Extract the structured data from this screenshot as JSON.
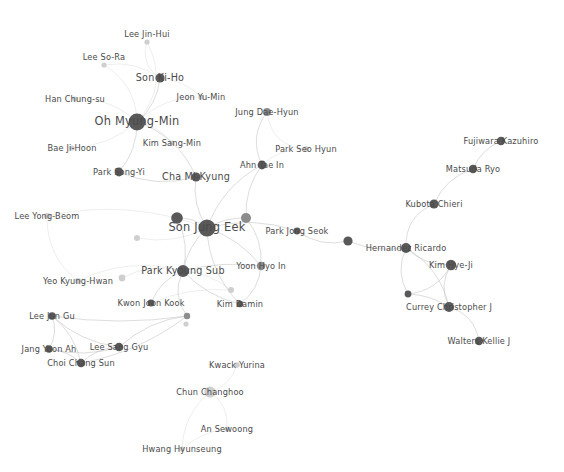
{
  "figure": {
    "type": "network-graph",
    "title": "",
    "background_color": "#ffffff",
    "node_color_dark": "#595959",
    "node_color_mid": "#8c8c8c",
    "node_color_light": "#cfcfcf",
    "edge_color": "#b9b9b9",
    "label_color": "#4a4a4a",
    "width": 564,
    "height": 472
  },
  "chart_data": {
    "type": "scatter",
    "title": "",
    "xlabel": "",
    "ylabel": "",
    "layout": "force-directed node-link diagram",
    "grid": false,
    "legend": "none",
    "node_count": 42,
    "nodes": [
      {
        "id": "lee-jin-hui",
        "label": "Lee Jin-Hui",
        "x": 147,
        "y": 42,
        "r": 2.6,
        "tone": "light",
        "label_dx": 0,
        "label_dy": -8,
        "size_class": "small"
      },
      {
        "id": "lee-so-ra",
        "label": "Lee So-Ra",
        "x": 104,
        "y": 65,
        "r": 2.6,
        "tone": "light",
        "label_dx": 0,
        "label_dy": -8,
        "size_class": "small"
      },
      {
        "id": "son-ki-ho",
        "label": "Son Ki-Ho",
        "x": 160,
        "y": 78,
        "r": 4.6,
        "tone": "dark",
        "label_dx": 0,
        "label_dy": 0,
        "size_class": "mid"
      },
      {
        "id": "han-chung-su",
        "label": "Han Chung-su",
        "x": 75,
        "y": 99,
        "r": 2.6,
        "tone": "light",
        "label_dx": 0,
        "label_dy": 0,
        "size_class": "small"
      },
      {
        "id": "jeon-yu-min",
        "label": "Jeon Yu-Min",
        "x": 201,
        "y": 97,
        "r": 2.6,
        "tone": "light",
        "label_dx": 0,
        "label_dy": 0,
        "size_class": "small"
      },
      {
        "id": "oh-myung-min",
        "label": "Oh Myung-Min",
        "x": 137,
        "y": 122,
        "r": 8.4,
        "tone": "dark",
        "label_dx": 0,
        "label_dy": 0,
        "size_class": "big"
      },
      {
        "id": "jung-dae-hyun",
        "label": "Jung Dae-Hyun",
        "x": 267,
        "y": 112,
        "r": 4.0,
        "tone": "mid",
        "label_dx": 0,
        "label_dy": 0,
        "size_class": "small"
      },
      {
        "id": "kim-sang-min",
        "label": "Kim Sang-Min",
        "x": 172,
        "y": 143,
        "r": 2.6,
        "tone": "light",
        "label_dx": 0,
        "label_dy": 0,
        "size_class": "small"
      },
      {
        "id": "park-seo-hyun",
        "label": "Park Seo Hyun",
        "x": 306,
        "y": 149,
        "r": 2.8,
        "tone": "light",
        "label_dx": 0,
        "label_dy": 0,
        "size_class": "small"
      },
      {
        "id": "bae-ji-hoon",
        "label": "Bae Ji-Hoon",
        "x": 72,
        "y": 148,
        "r": 2.6,
        "tone": "light",
        "label_dx": 0,
        "label_dy": 0,
        "size_class": "small"
      },
      {
        "id": "ahn-tae-in",
        "label": "Ahn Tae In",
        "x": 262,
        "y": 165,
        "r": 4.4,
        "tone": "dark",
        "label_dx": 0,
        "label_dy": 0,
        "size_class": "small"
      },
      {
        "id": "park-song-yi",
        "label": "Park Song-Yi",
        "x": 119,
        "y": 172,
        "r": 4.4,
        "tone": "dark",
        "label_dx": 0,
        "label_dy": 0,
        "size_class": "small"
      },
      {
        "id": "cha-mi-kyung",
        "label": "Cha Mi-Kyung",
        "x": 196,
        "y": 177,
        "r": 4.6,
        "tone": "dark",
        "label_dx": 0,
        "label_dy": 0,
        "size_class": "mid"
      },
      {
        "id": "fujiwara-kazuhiro",
        "label": "Fujiwara Kazuhiro",
        "x": 501,
        "y": 141,
        "r": 4.2,
        "tone": "dark",
        "label_dx": 0,
        "label_dy": 0,
        "size_class": "small"
      },
      {
        "id": "matsuda-ryo",
        "label": "Matsuda Ryo",
        "x": 473,
        "y": 169,
        "r": 4.2,
        "tone": "dark",
        "label_dx": 0,
        "label_dy": 0,
        "size_class": "small"
      },
      {
        "id": "kubota-chieri",
        "label": "Kubota Chieri",
        "x": 434,
        "y": 204,
        "r": 4.6,
        "tone": "dark",
        "label_dx": 0,
        "label_dy": 0,
        "size_class": "small"
      },
      {
        "id": "lee-yong-beom",
        "label": "Lee Yong-Beom",
        "x": 47,
        "y": 216,
        "r": 3.0,
        "tone": "light",
        "label_dx": 0,
        "label_dy": 0,
        "size_class": "small"
      },
      {
        "id": "son-jung-eek",
        "label": "Son Jung Eek",
        "x": 207,
        "y": 228,
        "r": 8.6,
        "tone": "dark",
        "label_dx": 0,
        "label_dy": 0,
        "size_class": "big"
      },
      {
        "id": "node-unlabeled-a",
        "label": "",
        "x": 177,
        "y": 218,
        "r": 5.8,
        "tone": "dark",
        "label_dx": 0,
        "label_dy": 0,
        "size_class": "small"
      },
      {
        "id": "node-unlabeled-b",
        "label": "",
        "x": 246,
        "y": 218,
        "r": 5.0,
        "tone": "mid",
        "label_dx": 0,
        "label_dy": 0,
        "size_class": "small"
      },
      {
        "id": "node-unlabeled-c",
        "label": "",
        "x": 137,
        "y": 238,
        "r": 3.0,
        "tone": "light",
        "label_dx": 0,
        "label_dy": 0,
        "size_class": "small"
      },
      {
        "id": "park-jong-seok",
        "label": "Park Jong Seok",
        "x": 297,
        "y": 231,
        "r": 3.4,
        "tone": "dark",
        "label_dx": 0,
        "label_dy": 0,
        "size_class": "small"
      },
      {
        "id": "node-unlabeled-d",
        "label": "",
        "x": 348,
        "y": 241,
        "r": 4.6,
        "tone": "dark",
        "label_dx": 0,
        "label_dy": 0,
        "size_class": "small"
      },
      {
        "id": "hernandez-ricardo",
        "label": "Hernandez Ricardo",
        "x": 406,
        "y": 248,
        "r": 5.0,
        "tone": "dark",
        "label_dx": 0,
        "label_dy": 0,
        "size_class": "small"
      },
      {
        "id": "kim-hye-ji",
        "label": "Kim Hye-Ji",
        "x": 451,
        "y": 265,
        "r": 5.2,
        "tone": "dark",
        "label_dx": 0,
        "label_dy": 0,
        "size_class": "small"
      },
      {
        "id": "park-kyoung-sub",
        "label": "Park Kyoung Sub",
        "x": 183,
        "y": 271,
        "r": 6.0,
        "tone": "dark",
        "label_dx": 0,
        "label_dy": 0,
        "size_class": "mid"
      },
      {
        "id": "yoon-hyo-in",
        "label": "Yoon Hyo In",
        "x": 261,
        "y": 266,
        "r": 4.2,
        "tone": "mid",
        "label_dx": 0,
        "label_dy": 0,
        "size_class": "small"
      },
      {
        "id": "yeo-kyung-hwan",
        "label": "Yeo Kyung-Hwan",
        "x": 78,
        "y": 281,
        "r": 3.0,
        "tone": "light",
        "label_dx": 0,
        "label_dy": 0,
        "size_class": "small"
      },
      {
        "id": "node-unlabeled-e",
        "label": "",
        "x": 122,
        "y": 278,
        "r": 3.4,
        "tone": "light",
        "label_dx": 0,
        "label_dy": 0,
        "size_class": "small"
      },
      {
        "id": "node-unlabeled-f",
        "label": "",
        "x": 231,
        "y": 290,
        "r": 3.0,
        "tone": "light",
        "label_dx": 0,
        "label_dy": 0,
        "size_class": "small"
      },
      {
        "id": "kwon-joon-kook",
        "label": "Kwon Joon Kook",
        "x": 151,
        "y": 303,
        "r": 3.4,
        "tone": "dark",
        "label_dx": 0,
        "label_dy": 0,
        "size_class": "small"
      },
      {
        "id": "kim-damin",
        "label": "Kim Damin",
        "x": 240,
        "y": 304,
        "r": 3.2,
        "tone": "dark",
        "label_dx": 0,
        "label_dy": 0,
        "size_class": "small"
      },
      {
        "id": "currey-christopher-j",
        "label": "Currey Christopher J",
        "x": 449,
        "y": 307,
        "r": 5.0,
        "tone": "dark",
        "label_dx": 0,
        "label_dy": 0,
        "size_class": "small"
      },
      {
        "id": "node-unlabeled-g",
        "label": "",
        "x": 408,
        "y": 294,
        "r": 3.4,
        "tone": "dark",
        "label_dx": 0,
        "label_dy": 0,
        "size_class": "small"
      },
      {
        "id": "node-unlabeled-h",
        "label": "",
        "x": 187,
        "y": 316,
        "r": 3.2,
        "tone": "mid",
        "label_dx": 0,
        "label_dy": 0,
        "size_class": "small"
      },
      {
        "id": "node-unlabeled-i",
        "label": "",
        "x": 186,
        "y": 324,
        "r": 2.6,
        "tone": "light",
        "label_dx": 0,
        "label_dy": 0,
        "size_class": "small"
      },
      {
        "id": "lee-jun-gu",
        "label": "Lee Jun Gu",
        "x": 52,
        "y": 316,
        "r": 3.8,
        "tone": "dark",
        "label_dx": 0,
        "label_dy": 0,
        "size_class": "small"
      },
      {
        "id": "jang-yoon-ah",
        "label": "Jang Yoon Ah",
        "x": 49,
        "y": 349,
        "r": 3.8,
        "tone": "dark",
        "label_dx": 0,
        "label_dy": 0,
        "size_class": "small"
      },
      {
        "id": "lee-sang-gyu",
        "label": "Lee Sang Gyu",
        "x": 119,
        "y": 347,
        "r": 4.2,
        "tone": "dark",
        "label_dx": 0,
        "label_dy": 0,
        "size_class": "small"
      },
      {
        "id": "choi-chang-sun",
        "label": "Choi Chang Sun",
        "x": 81,
        "y": 363,
        "r": 4.2,
        "tone": "dark",
        "label_dx": 0,
        "label_dy": 0,
        "size_class": "small"
      },
      {
        "id": "walters-kellie-j",
        "label": "Walters Kellie J",
        "x": 479,
        "y": 341,
        "r": 4.2,
        "tone": "dark",
        "label_dx": 0,
        "label_dy": 0,
        "size_class": "small"
      },
      {
        "id": "kwack-yurina",
        "label": "Kwack Yurina",
        "x": 237,
        "y": 365,
        "r": 2.8,
        "tone": "light",
        "label_dx": 0,
        "label_dy": 0,
        "size_class": "small"
      },
      {
        "id": "chun-changhoo",
        "label": "Chun Changhoo",
        "x": 210,
        "y": 392,
        "r": 5.6,
        "tone": "light",
        "label_dx": 0,
        "label_dy": 0,
        "size_class": "small"
      },
      {
        "id": "an-sewoong",
        "label": "An Sewoong",
        "x": 227,
        "y": 429,
        "r": 2.6,
        "tone": "light",
        "label_dx": 0,
        "label_dy": 0,
        "size_class": "small"
      },
      {
        "id": "hwang-hyunseung",
        "label": "Hwang Hyunseung",
        "x": 182,
        "y": 449,
        "r": 2.6,
        "tone": "light",
        "label_dx": 0,
        "label_dy": 0,
        "size_class": "small"
      }
    ],
    "edges": [
      {
        "source": "oh-myung-min",
        "target": "lee-jin-hui",
        "curve": 28
      },
      {
        "source": "oh-myung-min",
        "target": "lee-so-ra",
        "curve": 18
      },
      {
        "source": "oh-myung-min",
        "target": "son-ki-ho",
        "curve": 10
      },
      {
        "source": "oh-myung-min",
        "target": "han-chung-su",
        "curve": 14
      },
      {
        "source": "oh-myung-min",
        "target": "jeon-yu-min",
        "curve": -14
      },
      {
        "source": "oh-myung-min",
        "target": "kim-sang-min",
        "curve": -8
      },
      {
        "source": "oh-myung-min",
        "target": "bae-ji-hoon",
        "curve": -12
      },
      {
        "source": "oh-myung-min",
        "target": "park-song-yi",
        "curve": -10
      },
      {
        "source": "oh-myung-min",
        "target": "cha-mi-kyung",
        "curve": -18
      },
      {
        "source": "son-ki-ho",
        "target": "lee-jin-hui",
        "curve": -14
      },
      {
        "source": "son-ki-ho",
        "target": "jeon-yu-min",
        "curve": -8
      },
      {
        "source": "son-ki-ho",
        "target": "lee-so-ra",
        "curve": 12
      },
      {
        "source": "cha-mi-kyung",
        "target": "son-jung-eek",
        "curve": 10
      },
      {
        "source": "cha-mi-kyung",
        "target": "park-song-yi",
        "curve": -14
      },
      {
        "source": "ahn-tae-in",
        "target": "jung-dae-hyun",
        "curve": -16
      },
      {
        "source": "ahn-tae-in",
        "target": "park-seo-hyun",
        "curve": -10
      },
      {
        "source": "jung-dae-hyun",
        "target": "park-seo-hyun",
        "curve": 22
      },
      {
        "source": "ahn-tae-in",
        "target": "son-jung-eek",
        "curve": 16
      },
      {
        "source": "ahn-tae-in",
        "target": "node-unlabeled-b",
        "curve": 10
      },
      {
        "source": "son-jung-eek",
        "target": "node-unlabeled-a",
        "curve": 6
      },
      {
        "source": "son-jung-eek",
        "target": "node-unlabeled-b",
        "curve": -6
      },
      {
        "source": "son-jung-eek",
        "target": "node-unlabeled-c",
        "curve": -12
      },
      {
        "source": "son-jung-eek",
        "target": "park-kyoung-sub",
        "curve": 8
      },
      {
        "source": "son-jung-eek",
        "target": "yoon-hyo-in",
        "curve": -10
      },
      {
        "source": "son-jung-eek",
        "target": "park-jong-seok",
        "curve": -14
      },
      {
        "source": "son-jung-eek",
        "target": "kim-damin",
        "curve": 16
      },
      {
        "source": "son-jung-eek",
        "target": "lee-yong-beom",
        "curve": 24
      },
      {
        "source": "node-unlabeled-a",
        "target": "park-kyoung-sub",
        "curve": -10
      },
      {
        "source": "park-kyoung-sub",
        "target": "yoon-hyo-in",
        "curve": -8
      },
      {
        "source": "park-kyoung-sub",
        "target": "kim-damin",
        "curve": 10
      },
      {
        "source": "park-kyoung-sub",
        "target": "kwon-joon-kook",
        "curve": 10
      },
      {
        "source": "park-kyoung-sub",
        "target": "node-unlabeled-e",
        "curve": 12
      },
      {
        "source": "park-kyoung-sub",
        "target": "node-unlabeled-f",
        "curve": -8
      },
      {
        "source": "park-kyoung-sub",
        "target": "yeo-kyung-hwan",
        "curve": 20
      },
      {
        "source": "park-kyoung-sub",
        "target": "node-unlabeled-h",
        "curve": 14
      },
      {
        "source": "lee-yong-beom",
        "target": "yeo-kyung-hwan",
        "curve": 18
      },
      {
        "source": "yoon-hyo-in",
        "target": "node-unlabeled-b",
        "curve": 10
      },
      {
        "source": "yoon-hyo-in",
        "target": "kim-damin",
        "curve": -10
      },
      {
        "source": "park-jong-seok",
        "target": "node-unlabeled-d",
        "curve": 12
      },
      {
        "source": "node-unlabeled-d",
        "target": "hernandez-ricardo",
        "curve": 8
      },
      {
        "source": "hernandez-ricardo",
        "target": "kubota-chieri",
        "curve": -18
      },
      {
        "source": "kubota-chieri",
        "target": "matsuda-ryo",
        "curve": -12
      },
      {
        "source": "matsuda-ryo",
        "target": "fujiwara-kazuhiro",
        "curve": -8
      },
      {
        "source": "hernandez-ricardo",
        "target": "kim-hye-ji",
        "curve": 10
      },
      {
        "source": "hernandez-ricardo",
        "target": "currey-christopher-j",
        "curve": -16
      },
      {
        "source": "hernandez-ricardo",
        "target": "node-unlabeled-g",
        "curve": 12
      },
      {
        "source": "kim-hye-ji",
        "target": "currey-christopher-j",
        "curve": 12
      },
      {
        "source": "kim-hye-ji",
        "target": "node-unlabeled-g",
        "curve": -14
      },
      {
        "source": "currey-christopher-j",
        "target": "walters-kellie-j",
        "curve": -14
      },
      {
        "source": "currey-christopher-j",
        "target": "node-unlabeled-g",
        "curve": 6
      },
      {
        "source": "lee-jun-gu",
        "target": "jang-yoon-ah",
        "curve": -8
      },
      {
        "source": "lee-jun-gu",
        "target": "lee-sang-gyu",
        "curve": 12
      },
      {
        "source": "lee-jun-gu",
        "target": "choi-chang-sun",
        "curve": -10
      },
      {
        "source": "lee-jun-gu",
        "target": "node-unlabeled-h",
        "curve": 10
      },
      {
        "source": "jang-yoon-ah",
        "target": "lee-sang-gyu",
        "curve": 10
      },
      {
        "source": "jang-yoon-ah",
        "target": "choi-chang-sun",
        "curve": -6
      },
      {
        "source": "lee-sang-gyu",
        "target": "choi-chang-sun",
        "curve": 8
      },
      {
        "source": "lee-sang-gyu",
        "target": "node-unlabeled-h",
        "curve": -12
      },
      {
        "source": "choi-chang-sun",
        "target": "node-unlabeled-h",
        "curve": 14
      },
      {
        "source": "chun-changhoo",
        "target": "kwack-yurina",
        "curve": 10
      },
      {
        "source": "chun-changhoo",
        "target": "an-sewoong",
        "curve": -12
      },
      {
        "source": "chun-changhoo",
        "target": "hwang-hyunseung",
        "curve": 14
      },
      {
        "source": "an-sewoong",
        "target": "hwang-hyunseung",
        "curve": 8
      },
      {
        "source": "kwon-joon-kook",
        "target": "node-unlabeled-f",
        "curve": -10
      }
    ]
  }
}
